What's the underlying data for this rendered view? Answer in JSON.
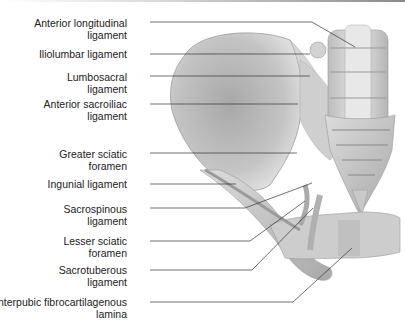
{
  "labels": [
    {
      "line1": "Anterior longitudinal",
      "line2": "ligament"
    },
    {
      "line1": "Iliolumbar ligament",
      "line2": ""
    },
    {
      "line1": "Lumbosacral",
      "line2": "ligament"
    },
    {
      "line1": "Anterior sacroiliac",
      "line2": "ligament"
    },
    {
      "line1": "Greater sciatic",
      "line2": "foramen"
    },
    {
      "line1": "Ingunial ligament",
      "line2": ""
    },
    {
      "line1": "Sacrospinous",
      "line2": "ligament"
    },
    {
      "line1": "Lesser sciatic",
      "line2": "foramen"
    },
    {
      "line1": "Sacrotuberous",
      "line2": "ligament"
    },
    {
      "line1": "Interpubic fibrocartilagenous",
      "line2": "lamina"
    }
  ]
}
